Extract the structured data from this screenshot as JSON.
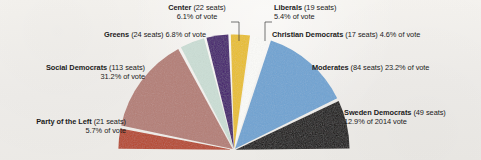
{
  "chart_data": {
    "type": "pie",
    "title": "",
    "subtitle": "",
    "variant": "half-pie",
    "legend_position": "outside-callouts",
    "grid": false,
    "total_seats": 349,
    "categories": [
      "Sweden Democrats",
      "Moderates",
      "Christian Democrats",
      "Liberals",
      "Center",
      "Greens",
      "Social Democrats",
      "Party of the Left"
    ],
    "values": [
      49,
      84,
      17,
      19,
      22,
      24,
      113,
      21
    ],
    "percentages": [
      12.9,
      23.2,
      4.6,
      5.4,
      6.1,
      6.8,
      31.2,
      5.7
    ],
    "colors": [
      "#14100f",
      "#6fa3d2",
      "#fbfbf8",
      "#e9bf2c",
      "#451b6e",
      "#cbded5",
      "#b47e76",
      "#b6472c"
    ],
    "xlabel": "",
    "ylabel": "",
    "slices": [
      {
        "key": "sweden-democrats",
        "party": "Sweden Democrats",
        "seats": 49,
        "percent": 12.9,
        "color": "#14100f",
        "label_party": "Sweden Democrats",
        "label_detail": " (49 seats)",
        "label_line2": "12.9% of 2014 vote",
        "start_deg": 0.0,
        "end_deg": 25.8
      },
      {
        "key": "moderates",
        "party": "Moderates",
        "seats": 84,
        "percent": 23.2,
        "color": "#6fa3d2",
        "label_party": "Moderates",
        "label_detail": " (84 seats) 23.2% of vote",
        "label_line2": "",
        "start_deg": 25.8,
        "end_deg": 72.2
      },
      {
        "key": "christian-democrats",
        "party": "Christian Democrats",
        "seats": 17,
        "percent": 4.6,
        "color": "#fbfbf8",
        "label_party": "Christian Democrats",
        "label_detail": " (17 seats) 4.6% of vote",
        "label_line2": "",
        "start_deg": 72.2,
        "end_deg": 81.4
      },
      {
        "key": "liberals",
        "party": "Liberals",
        "seats": 19,
        "percent": 5.4,
        "color": "#e9bf2c",
        "label_party": "Liberals",
        "label_detail": " (19 seats)",
        "label_line2": "5.4% of vote",
        "start_deg": 81.4,
        "end_deg": 92.2
      },
      {
        "key": "center",
        "party": "Center",
        "seats": 22,
        "percent": 6.1,
        "color": "#451b6e",
        "label_party": "Center",
        "label_detail": " (22 seats)",
        "label_line2": "6.1% of vote",
        "start_deg": 92.2,
        "end_deg": 104.4
      },
      {
        "key": "greens",
        "party": "Greens",
        "seats": 24,
        "percent": 6.8,
        "color": "#cbded5",
        "label_party": "Greens",
        "label_detail": " (24 seats) 6.8% of vote",
        "label_line2": "",
        "start_deg": 104.4,
        "end_deg": 118.0
      },
      {
        "key": "social-democrats",
        "party": "Social Democrats",
        "seats": 113,
        "percent": 31.2,
        "color": "#b47e76",
        "label_party": "Social Democrats",
        "label_detail": " (113 seats)",
        "label_line2": "31.2% of vote",
        "start_deg": 118.0,
        "end_deg": 168.6
      },
      {
        "key": "party-of-the-left",
        "party": "Party of the Left",
        "seats": 21,
        "percent": 5.7,
        "color": "#b6472c",
        "label_party": "Party of the Left",
        "label_detail": " (21 seats)",
        "label_line2": "5.7% of vote",
        "start_deg": 168.6,
        "end_deg": 180.0
      }
    ]
  },
  "geometry": {
    "cx": 234,
    "cy": 150,
    "radius": 114,
    "gap_deg": 1.1,
    "explode": 1.6
  },
  "callouts": {
    "center_leader": "leader-line-center",
    "liberals_leader": "leader-line-liberals",
    "line_color": "#3a3a3a"
  }
}
